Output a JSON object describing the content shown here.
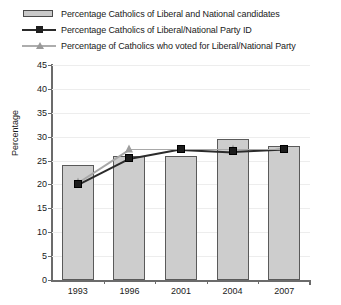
{
  "chart_data": {
    "type": "bar",
    "title": "",
    "xlabel": "",
    "ylabel": "Percentage",
    "categories": [
      "1993",
      "1996",
      "2001",
      "2004",
      "2007"
    ],
    "ylim": [
      0,
      45
    ],
    "yticks": [
      0,
      5,
      10,
      15,
      20,
      25,
      30,
      35,
      40,
      45
    ],
    "grid": true,
    "legend_position": "top-left",
    "series": [
      {
        "name": "Percentage Catholics of Liberal and National candidates",
        "marker": "bar",
        "color": "#cdcdcd",
        "values": [
          24,
          26,
          26,
          29.5,
          28
        ]
      },
      {
        "name": "Percentage Catholics of Liberal/National Party ID",
        "marker": "square",
        "color": "#1c1c1c",
        "values": [
          20,
          25.5,
          27.5,
          27,
          27.5
        ]
      },
      {
        "name": "Percentage of Catholics who voted for Liberal/National Party",
        "marker": "triangle",
        "color": "#9e9e9e",
        "values": [
          20.5,
          27.5,
          27.5,
          27.5,
          27.5
        ]
      }
    ]
  },
  "legend": {
    "items": [
      {
        "label": "Percentage Catholics of Liberal and National candidates",
        "key": "bar-swatch"
      },
      {
        "label": "Percentage Catholics of Liberal/National Party ID",
        "key": "line-square-marker"
      },
      {
        "label": "Percentage of Catholics who voted for Liberal/National Party",
        "key": "line-triangle-marker"
      }
    ]
  }
}
